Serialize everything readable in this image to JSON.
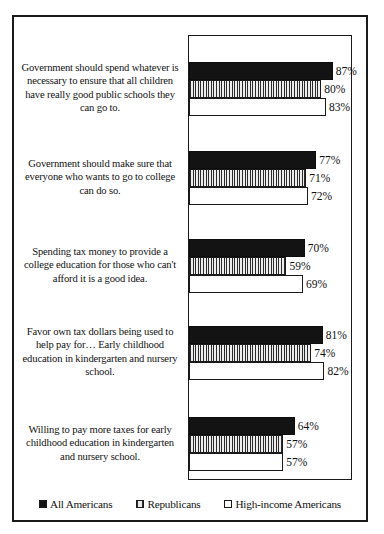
{
  "chart_data": {
    "type": "bar",
    "orientation": "horizontal",
    "title": "",
    "xlabel": "",
    "ylabel": "",
    "xlim": [
      0,
      100
    ],
    "grid": false,
    "legend_position": "bottom",
    "categories": [
      "Government should spend whatever is necessary to ensure that all children have really good public schools they can go to.",
      "Government should make sure that everyone who wants to go to college can do so.",
      "Spending tax money to provide a college education for those who can't afford it is a good idea.",
      "Favor own tax dollars being used to help pay for… Early childhood education in kindergarten and nursery school.",
      "Willing to pay more taxes for early childhood education in kindergarten and nursery school."
    ],
    "series": [
      {
        "name": "All Americans",
        "fill": "solid-black",
        "color": "#131313",
        "values": [
          87,
          77,
          70,
          81,
          64
        ],
        "labels": [
          "87%",
          "77%",
          "70%",
          "81%",
          "64%"
        ]
      },
      {
        "name": "Republicans",
        "fill": "vertical-hatch",
        "color": "#c9c9c9",
        "values": [
          80,
          71,
          59,
          74,
          57
        ],
        "labels": [
          "80%",
          "71%",
          "59%",
          "74%",
          "57%"
        ]
      },
      {
        "name": "High-income Americans",
        "fill": "white",
        "color": "#ffffff",
        "values": [
          83,
          72,
          69,
          82,
          57
        ],
        "labels": [
          "83%",
          "72%",
          "69%",
          "82%",
          "57%"
        ]
      }
    ]
  },
  "legend": {
    "items": [
      {
        "label": "All Americans",
        "swatch": "solid-black-square-icon"
      },
      {
        "label": "Republicans",
        "swatch": "hatched-square-icon"
      },
      {
        "label": "High-income Americans",
        "swatch": "white-square-icon"
      }
    ]
  }
}
